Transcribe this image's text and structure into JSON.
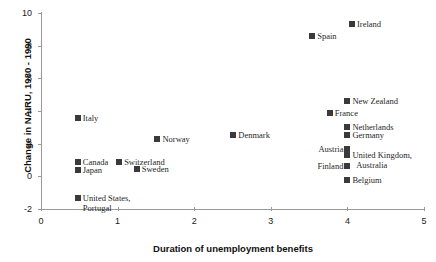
{
  "chart_data": {
    "type": "scatter",
    "title": "",
    "xlabel": "Duration of unemployment benefits",
    "ylabel": "Change in NAIRU, 1980 - 1990",
    "xlim": [
      0,
      5
    ],
    "ylim": [
      -2,
      10
    ],
    "xticks": [
      "0",
      "1",
      "2",
      "3",
      "4",
      "5"
    ],
    "xtick_values": [
      0,
      1,
      2,
      3,
      4,
      5
    ],
    "yticks": [
      "-2",
      "0",
      "2",
      "4",
      "6",
      "8",
      "10"
    ],
    "ytick_values": [
      -2,
      0,
      2,
      4,
      6,
      8,
      10
    ],
    "grid": false,
    "legend": "none",
    "marker_color": "#3a3a3a",
    "axis_color": "#9a9a9a",
    "points": [
      {
        "label": "Italy",
        "x": 0.48,
        "y": 3.6,
        "side": "right"
      },
      {
        "label": "Canada",
        "x": 0.48,
        "y": 0.9,
        "side": "right"
      },
      {
        "label": "Japan",
        "x": 0.48,
        "y": 0.4,
        "side": "right"
      },
      {
        "label": "United States,\nPortugal",
        "x": 0.48,
        "y": -1.35,
        "side": "right"
      },
      {
        "label": "Switzerland",
        "x": 1.02,
        "y": 0.85,
        "side": "right"
      },
      {
        "label": "Sweden",
        "x": 1.25,
        "y": 0.45,
        "side": "right"
      },
      {
        "label": "Norway",
        "x": 1.52,
        "y": 2.3,
        "side": "right"
      },
      {
        "label": "Denmark",
        "x": 2.51,
        "y": 2.55,
        "side": "right"
      },
      {
        "label": "Spain",
        "x": 3.54,
        "y": 8.6,
        "side": "right"
      },
      {
        "label": "Ireland",
        "x": 4.06,
        "y": 9.3,
        "side": "right"
      },
      {
        "label": "New Zealand",
        "x": 4.0,
        "y": 4.6,
        "side": "right"
      },
      {
        "label": "France",
        "x": 3.77,
        "y": 3.9,
        "side": "right"
      },
      {
        "label": "Netherlands",
        "x": 4.0,
        "y": 3.05,
        "side": "right"
      },
      {
        "label": "Germany",
        "x": 4.0,
        "y": 2.55,
        "side": "right"
      },
      {
        "label": "Austria",
        "x": 4.0,
        "y": 1.7,
        "side": "left"
      },
      {
        "label": "United Kingdom,\n  Australia",
        "x": 4.0,
        "y": 1.3,
        "side": "right"
      },
      {
        "label": "Finland",
        "x": 4.0,
        "y": 0.65,
        "side": "left"
      },
      {
        "label": "Belgium",
        "x": 4.0,
        "y": -0.2,
        "side": "right"
      }
    ]
  }
}
